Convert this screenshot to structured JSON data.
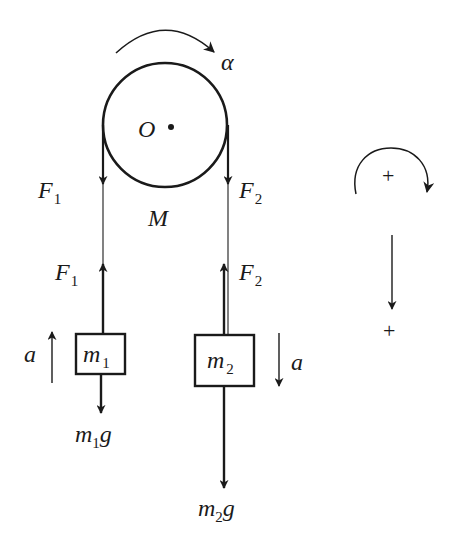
{
  "figure": {
    "colors": {
      "ink": "#1a1a1a",
      "background": "#ffffff"
    }
  },
  "pulley": {
    "center_label": "O",
    "mass_label": "M",
    "angular_accel_label": "α"
  },
  "left_side": {
    "tension_top": {
      "main": "F",
      "sub": "1"
    },
    "tension_bottom": {
      "main": "F",
      "sub": "1"
    },
    "block": {
      "main": "m",
      "sub": "1"
    },
    "weight": {
      "main": "m",
      "sub": "1",
      "tail": "g"
    },
    "accel_label": "a",
    "accel_direction": "up"
  },
  "right_side": {
    "tension_top": {
      "main": "F",
      "sub": "2"
    },
    "tension_bottom": {
      "main": "F",
      "sub": "2"
    },
    "block": {
      "main": "m",
      "sub": "2"
    },
    "weight": {
      "main": "m",
      "sub": "2",
      "tail": "g"
    },
    "accel_label": "a",
    "accel_direction": "down"
  },
  "sign_convention": {
    "rotation_plus": "+",
    "linear_plus": "+"
  }
}
